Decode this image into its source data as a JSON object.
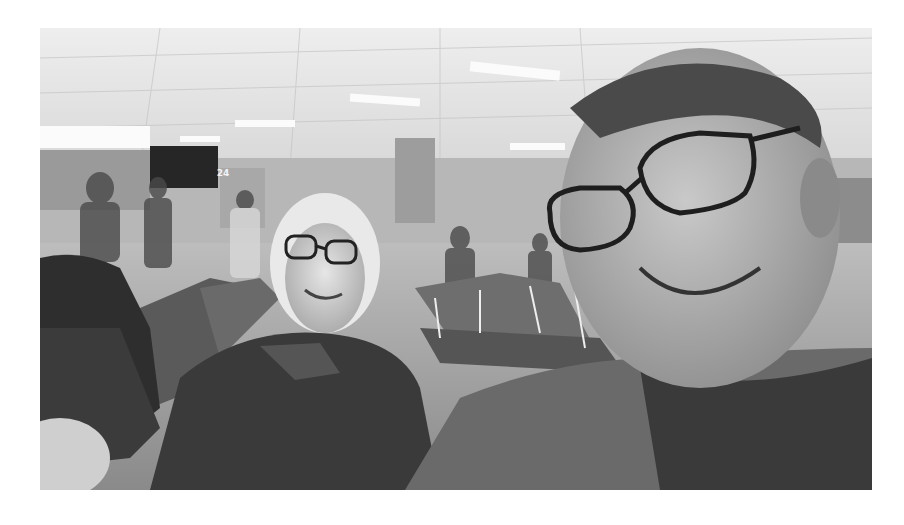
{
  "image": {
    "description": "Grayscale selfie of two people seated in an airport gate waiting area",
    "style": "black-and-white photograph",
    "gate_sign": {
      "number": "24"
    },
    "subjects": [
      {
        "id": "older-woman",
        "description": "elderly woman with white hair and glasses, wearing a dark fleece jacket, smiling"
      },
      {
        "id": "man",
        "description": "man with glasses taking the selfie, wearing a dark t-shirt, smiling"
      }
    ],
    "background": "airport terminal with ceiling tiles and lights, rows of gate seating, other travelers"
  }
}
